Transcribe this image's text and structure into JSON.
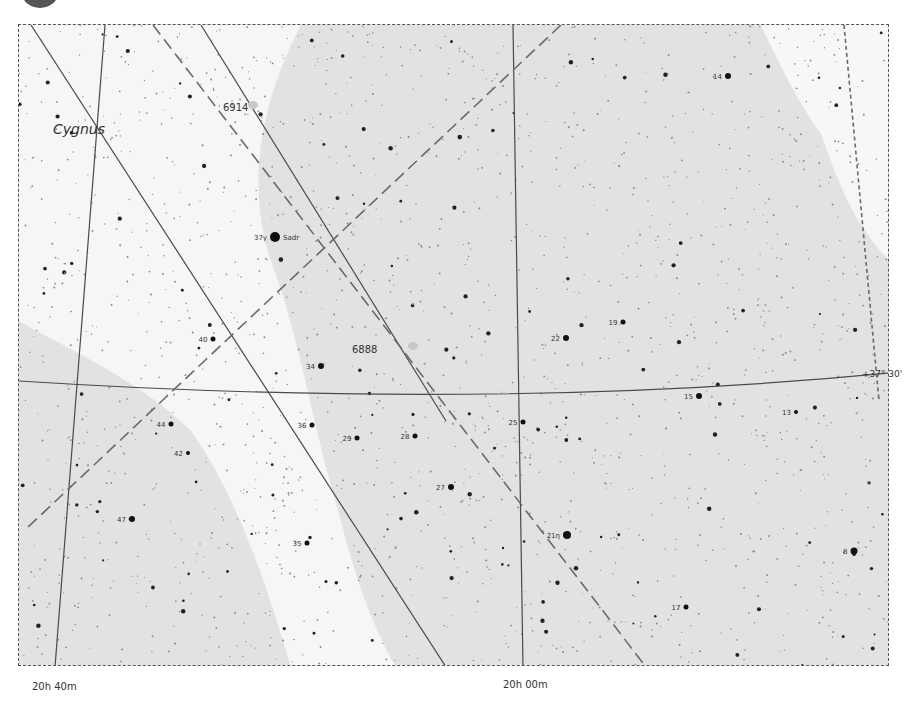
{
  "chart": {
    "constellation_label": "Cygnus",
    "ra_labels": [
      {
        "text": "20h 40m",
        "x": 32,
        "y": 681
      },
      {
        "text": "20h 00m",
        "x": 503,
        "y": 679
      }
    ],
    "dec_labels": [
      {
        "text": "+37° 30'",
        "x": 862,
        "y": 369
      }
    ],
    "colors": {
      "background_light": "#f6f6f6",
      "band_gray": "#dcdcdc",
      "band_mid": "#e6e6e6",
      "grid_line": "#4a4a4a",
      "dashed_line": "#6a6a6a",
      "star": "#111111",
      "text": "#333333"
    },
    "deep_sky_objects": [
      {
        "id": "6914",
        "label": "6914",
        "x": 222,
        "y": 108,
        "lx": 222,
        "ly": 110
      },
      {
        "id": "6888",
        "label": "6888",
        "x": 382,
        "y": 349,
        "lx": 351,
        "ly": 352
      }
    ],
    "named_stars": [
      {
        "label": "37γ",
        "name": "Sadr",
        "x": 274,
        "y": 236,
        "r": 5
      },
      {
        "label": "14",
        "x": 727,
        "y": 75,
        "r": 3
      },
      {
        "label": "22",
        "x": 565,
        "y": 337,
        "r": 3
      },
      {
        "label": "19",
        "x": 622,
        "y": 321,
        "r": 2.5
      },
      {
        "label": "15",
        "x": 698,
        "y": 395,
        "r": 3
      },
      {
        "label": "13",
        "x": 795,
        "y": 411,
        "r": 2
      },
      {
        "label": "40",
        "x": 212,
        "y": 338,
        "r": 2.5
      },
      {
        "label": "34",
        "x": 320,
        "y": 365,
        "r": 3
      },
      {
        "label": "44",
        "x": 170,
        "y": 423,
        "r": 2.5
      },
      {
        "label": "42",
        "x": 187,
        "y": 452,
        "r": 2
      },
      {
        "label": "36",
        "x": 311,
        "y": 424,
        "r": 2.5
      },
      {
        "label": "29",
        "x": 356,
        "y": 437,
        "r": 2.5
      },
      {
        "label": "28",
        "x": 414,
        "y": 435,
        "r": 2.5
      },
      {
        "label": "25",
        "x": 522,
        "y": 421,
        "r": 2.5
      },
      {
        "label": "27",
        "x": 450,
        "y": 486,
        "r": 3
      },
      {
        "label": "47",
        "x": 131,
        "y": 518,
        "r": 3
      },
      {
        "label": "35",
        "x": 306,
        "y": 542,
        "r": 2.5
      },
      {
        "label": "21η",
        "x": 566,
        "y": 534,
        "r": 4
      },
      {
        "label": "17",
        "x": 685,
        "y": 606,
        "r": 2.5
      },
      {
        "label": "8",
        "x": 853,
        "y": 550,
        "r": 3.5
      }
    ]
  }
}
